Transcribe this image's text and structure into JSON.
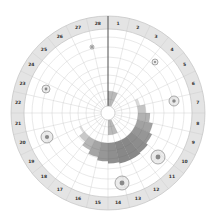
{
  "diagram": {
    "type": "circular-cycle-chart",
    "segments": 28,
    "labels": [
      "1",
      "2",
      "3",
      "4",
      "5",
      "6",
      "7",
      "8",
      "9",
      "10",
      "11",
      "12",
      "13",
      "14",
      "15",
      "16",
      "17",
      "18",
      "19",
      "20",
      "21",
      "22",
      "23",
      "24",
      "25",
      "26",
      "27",
      "28"
    ],
    "center": [
      108,
      113
    ],
    "radii": {
      "outer": 97,
      "label_inner": 84,
      "hub": 7,
      "rings": [
        14,
        22,
        30,
        38,
        46,
        56,
        66,
        76
      ]
    },
    "colors": {
      "label_ring": "#e4e4e4",
      "grid": "#c8c8c8",
      "marker_line": "#333333",
      "shade": "#555555"
    },
    "markers": [
      {
        "name": "marker-cell-3",
        "cx": 155,
        "cy": 62,
        "r": 3
      },
      {
        "name": "marker-cell-7",
        "cx": 174,
        "cy": 101,
        "r": 5
      },
      {
        "name": "marker-cell-10",
        "cx": 158,
        "cy": 157,
        "r": 7
      },
      {
        "name": "marker-cell-15",
        "cx": 122,
        "cy": 183,
        "r": 7
      },
      {
        "name": "marker-cell-20",
        "cx": 47,
        "cy": 137,
        "r": 6
      },
      {
        "name": "marker-cell-23",
        "cx": 46,
        "cy": 89,
        "r": 4
      },
      {
        "name": "marker-cell-27",
        "cx": 92,
        "cy": 47,
        "r": 2
      }
    ]
  }
}
